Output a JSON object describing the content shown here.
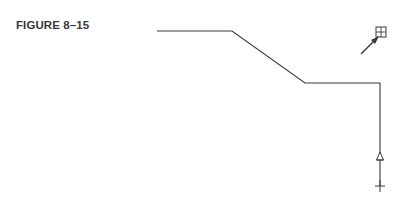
{
  "figure": {
    "label": "FIGURE 8–15"
  },
  "drawing": {
    "stroke_color": "#3a3a3a",
    "polyline": [
      [
        157,
        31
      ],
      [
        232,
        31
      ],
      [
        305,
        83
      ],
      [
        380,
        83
      ],
      [
        380,
        186
      ]
    ],
    "markers": [
      {
        "type": "triangle-icon",
        "x": 380,
        "y": 157
      },
      {
        "type": "crosshair-icon",
        "x": 380,
        "y": 186
      }
    ],
    "cursor": {
      "type": "pick-box-arrow-icon",
      "box_x": 376,
      "box_y": 27,
      "box_size": 10,
      "arrow_from": [
        361,
        54
      ],
      "arrow_to": [
        377,
        38
      ]
    }
  }
}
